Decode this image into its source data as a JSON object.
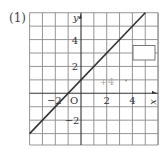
{
  "problem": {
    "label": "(1)"
  },
  "chart_data": {
    "type": "line",
    "title": "",
    "xlabel": "x",
    "ylabel": "y",
    "origin_label": "O",
    "xlim": [
      -4,
      6
    ],
    "ylim": [
      -4,
      6
    ],
    "grid": true,
    "x_tick_labels": [
      {
        "value": -2,
        "label": "−2"
      },
      {
        "value": 2,
        "label": "2"
      },
      {
        "value": 4,
        "label": "4"
      }
    ],
    "y_tick_labels": [
      {
        "value": 4,
        "label": "4"
      },
      {
        "value": 2,
        "label": "2"
      },
      {
        "value": -2,
        "label": "−2"
      }
    ],
    "series": [
      {
        "name": "line",
        "equation": "y = x + 1",
        "x": [
          -4,
          5
        ],
        "y": [
          -3,
          6
        ]
      }
    ],
    "annotations": [
      {
        "text": "+4",
        "x": 2,
        "y": 0.9,
        "color": "#aaaaaa"
      }
    ],
    "answer_box": {
      "x0": 4,
      "y0": 3.6,
      "x1": 5.8,
      "y1": 2.5
    }
  },
  "colors": {
    "grid": "#8a8a8a",
    "line": "#333333",
    "axis": "#333333",
    "annotation": "#aaaaaa"
  }
}
